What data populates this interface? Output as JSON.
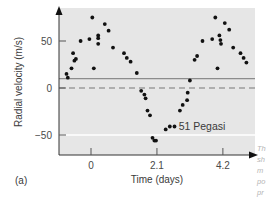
{
  "chart_data": {
    "type": "scatter",
    "title": "",
    "panel_label": "(a)",
    "annotation": "51 Pegasi",
    "xlabel": "Time (days)",
    "ylabel": "Radial velocity (m/s)",
    "x_ticks": [
      0,
      2.1,
      4.2
    ],
    "x_tick_labels": [
      "0",
      "2.1",
      "4.2"
    ],
    "y_ticks": [
      50,
      0,
      -50
    ],
    "y_tick_labels": [
      "50",
      "0",
      "−50"
    ],
    "xlim": [
      -0.9,
      5.0
    ],
    "ylim": [
      -70,
      85
    ],
    "grid": false,
    "reference_lines": [
      {
        "y": 0,
        "style": "dashed",
        "color": "#777777"
      },
      {
        "y": 10,
        "style": "solid",
        "color": "#8c8c8c"
      },
      {
        "y": -50,
        "style": "solid",
        "color": "#ffffff"
      }
    ],
    "series": [
      {
        "name": "51 Pegasi",
        "points": [
          [
            -0.78,
            15
          ],
          [
            -0.74,
            11
          ],
          [
            -0.62,
            21
          ],
          [
            -0.57,
            37
          ],
          [
            -0.53,
            29
          ],
          [
            -0.48,
            31
          ],
          [
            -0.33,
            50
          ],
          [
            -0.05,
            52
          ],
          [
            0.04,
            75
          ],
          [
            0.09,
            21
          ],
          [
            0.23,
            56
          ],
          [
            0.23,
            53
          ],
          [
            0.23,
            47
          ],
          [
            0.44,
            68
          ],
          [
            0.56,
            61
          ],
          [
            0.7,
            43
          ],
          [
            1.05,
            37
          ],
          [
            1.14,
            32
          ],
          [
            1.26,
            28
          ],
          [
            1.46,
            16
          ],
          [
            1.6,
            -3
          ],
          [
            1.7,
            -7
          ],
          [
            1.74,
            -11
          ],
          [
            1.8,
            -24
          ],
          [
            1.88,
            -29
          ],
          [
            1.96,
            -53
          ],
          [
            2.02,
            -56
          ],
          [
            2.07,
            -56
          ],
          [
            2.38,
            -44
          ],
          [
            2.51,
            -41
          ],
          [
            2.66,
            -41
          ],
          [
            2.83,
            -24
          ],
          [
            2.92,
            -18
          ],
          [
            3.06,
            -13
          ],
          [
            3.08,
            -5
          ],
          [
            3.15,
            8
          ],
          [
            3.3,
            30
          ],
          [
            3.38,
            34
          ],
          [
            3.55,
            50
          ],
          [
            3.86,
            52
          ],
          [
            3.96,
            75
          ],
          [
            4.03,
            21
          ],
          [
            4.09,
            56
          ],
          [
            4.12,
            51
          ],
          [
            4.14,
            47
          ],
          [
            4.26,
            69
          ],
          [
            4.4,
            62
          ],
          [
            4.53,
            43
          ],
          [
            4.76,
            37
          ],
          [
            4.86,
            32
          ],
          [
            4.95,
            27
          ]
        ]
      }
    ]
  },
  "side_caption_fragments": [
    "Th",
    "sh",
    "m",
    "po",
    "pr"
  ]
}
